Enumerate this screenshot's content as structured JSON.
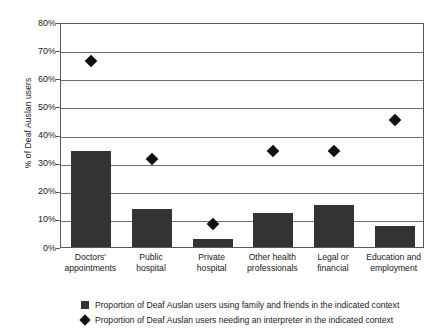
{
  "chart_data": {
    "type": "bar",
    "title": "",
    "subtitle": "",
    "xlabel": "",
    "ylabel": "% of Deaf Auslan users",
    "ylim": [
      0,
      80
    ],
    "ytick_labels": [
      "80%",
      "70%",
      "60%",
      "50%",
      "40%",
      "30%",
      "20%",
      "10%",
      "0%"
    ],
    "ytick_values": [
      80,
      70,
      60,
      50,
      40,
      30,
      20,
      10,
      0
    ],
    "grid": true,
    "legend_position": "bottom",
    "categories": [
      "Doctors' appointments",
      "Public hospital",
      "Private hospital",
      "Other health professionals",
      "Legal or financial",
      "Education and employment"
    ],
    "category_lines": [
      [
        "Doctors'",
        "appointments"
      ],
      [
        "Public",
        "hospital"
      ],
      [
        "Private",
        "hospital"
      ],
      [
        "Other health",
        "professionals"
      ],
      [
        "Legal or",
        "financial"
      ],
      [
        "Education and",
        "employment"
      ]
    ],
    "series": [
      {
        "name": "Proportion of Deaf Auslan users using family and friends in the indicated context",
        "marker": "square",
        "color": "#333333",
        "values": [
          34,
          13.5,
          3,
          12,
          15,
          7.5
        ]
      },
      {
        "name": "Proportion of Deaf Auslan users needing an interpreter in the indicated context",
        "marker": "diamond",
        "color": "#111111",
        "values": [
          67,
          32,
          9,
          35,
          35,
          46
        ]
      }
    ]
  },
  "legend": {
    "items": [
      {
        "icon": "legend-square-icon",
        "label": "Proportion of Deaf Auslan users using family and friends in the indicated context"
      },
      {
        "icon": "legend-diamond-icon",
        "label": "Proportion of Deaf Auslan users needing an interpreter in the indicated context"
      }
    ]
  }
}
